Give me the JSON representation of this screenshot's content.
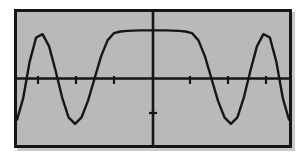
{
  "device": {
    "name": "graphing-calculator-screen",
    "screen_background": "#b9b9b9",
    "frame_color": "#161616",
    "page_background": "#ffffff"
  },
  "chart_data": {
    "type": "line",
    "title": "",
    "subtitle": "",
    "xlabel": "",
    "ylabel": "",
    "grid": false,
    "legend": null,
    "legend_position": "none",
    "axes": {
      "x_axis_shown": true,
      "y_axis_shown": true,
      "x_axis_pixel_y": 68,
      "y_axis_pixel_x": 136,
      "axis_color": "#161616",
      "tick_marks_x": [
        21,
        59,
        97,
        173,
        211,
        249
      ],
      "tick_marks_y": [
        101
      ],
      "tick_label_text": []
    },
    "xlim": [
      -6.2832,
      6.2832
    ],
    "ylim": [
      -3,
      3
    ],
    "x": [
      -6.28,
      -6.0,
      -5.7,
      -5.4,
      -5.1,
      -4.8,
      -4.5,
      -4.2,
      -3.9,
      -3.6,
      -3.3,
      -3.0,
      -2.7,
      -2.4,
      -2.1,
      -1.8,
      -1.5,
      -1.2,
      -0.9,
      -0.6,
      -0.3,
      0.0,
      0.3,
      0.6,
      0.9,
      1.2,
      1.5,
      1.8,
      2.1,
      2.4,
      2.7,
      3.0,
      3.3,
      3.6,
      3.9,
      4.2,
      4.5,
      4.8,
      5.1,
      5.4,
      5.7,
      6.0,
      6.28
    ],
    "y": [
      -1.85,
      -0.9,
      0.75,
      1.85,
      2.0,
      1.45,
      0.35,
      -0.85,
      -1.75,
      -2.05,
      -1.75,
      -1.0,
      0.0,
      1.0,
      1.72,
      2.05,
      2.12,
      2.15,
      2.16,
      2.17,
      2.17,
      2.17,
      2.17,
      2.17,
      2.16,
      2.15,
      2.12,
      2.05,
      1.72,
      1.0,
      0.0,
      -1.0,
      -1.75,
      -2.05,
      -1.75,
      -0.85,
      0.35,
      1.45,
      2.0,
      1.85,
      0.75,
      -0.9,
      -1.85
    ],
    "series": [
      {
        "name": "curve",
        "color": "#161616",
        "line_width": 2,
        "values": [
          -1.85,
          -0.9,
          0.75,
          1.85,
          2.0,
          1.45,
          0.35,
          -0.85,
          -1.75,
          -2.05,
          -1.75,
          -1.0,
          0.0,
          1.0,
          1.72,
          2.05,
          2.12,
          2.15,
          2.16,
          2.17,
          2.17,
          2.17,
          2.17,
          2.17,
          2.16,
          2.15,
          2.12,
          2.05,
          1.72,
          1.0,
          0.0,
          -1.0,
          -1.75,
          -2.05,
          -1.75,
          -0.85,
          0.35,
          1.45,
          2.0,
          1.85,
          0.75,
          -0.9,
          -1.85
        ]
      }
    ],
    "features": {
      "central_plateau_y": 2.17,
      "side_peaks_y": 2.05,
      "troughs_y": -2.05,
      "edge_values_y": -1.85
    }
  }
}
